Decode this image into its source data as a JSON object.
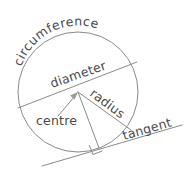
{
  "figure": {
    "background_color": "#ffffff",
    "stroke_color": "#8a8a8a",
    "text_color": "#4a4a4a",
    "labels": {
      "circumference": "circumference",
      "diameter": "diameter",
      "radius": "radius",
      "centre": "centre",
      "tangent": "tangent"
    },
    "geometry": {
      "circle": {
        "cx": 78,
        "cy": 92,
        "r": 60
      },
      "diameter_line": {
        "x1": 18,
        "y1": 108,
        "x2": 137,
        "y2": 62
      },
      "radius_line": {
        "x1": 78,
        "y1": 92,
        "x2": 131,
        "y2": 130
      },
      "radius_to_tangent_line": {
        "x1": 78,
        "y1": 92,
        "x2": 99,
        "y2": 148
      },
      "tangent_line": {
        "x1": 42,
        "y1": 166,
        "x2": 182,
        "y2": 125
      },
      "tangent_point": {
        "x": 99,
        "y": 148
      },
      "centre_arrow": {
        "x1": 60,
        "y1": 114,
        "x2": 77,
        "y2": 94
      },
      "right_angle_marker": true
    }
  }
}
